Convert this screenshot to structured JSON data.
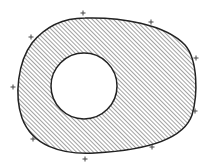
{
  "diagram": {
    "outer_region": {
      "shape": "egg",
      "bbox": {
        "left": 19,
        "top": 18,
        "right": 195,
        "bottom": 153
      },
      "fill": "diagonal-hatch",
      "stroke": "#222222",
      "hatch_color": "#777777",
      "hatch_spacing": 3
    },
    "hole": {
      "shape": "circle",
      "cx": 84,
      "cy": 86,
      "r": 33,
      "fill": "#ffffff",
      "stroke": "#222222"
    },
    "plus_marks": [
      {
        "x": 83,
        "y": 13
      },
      {
        "x": 151,
        "y": 22
      },
      {
        "x": 31,
        "y": 37
      },
      {
        "x": 196,
        "y": 58
      },
      {
        "x": 13,
        "y": 87
      },
      {
        "x": 195,
        "y": 111
      },
      {
        "x": 33,
        "y": 139
      },
      {
        "x": 152,
        "y": 147
      },
      {
        "x": 85,
        "y": 159
      }
    ]
  }
}
